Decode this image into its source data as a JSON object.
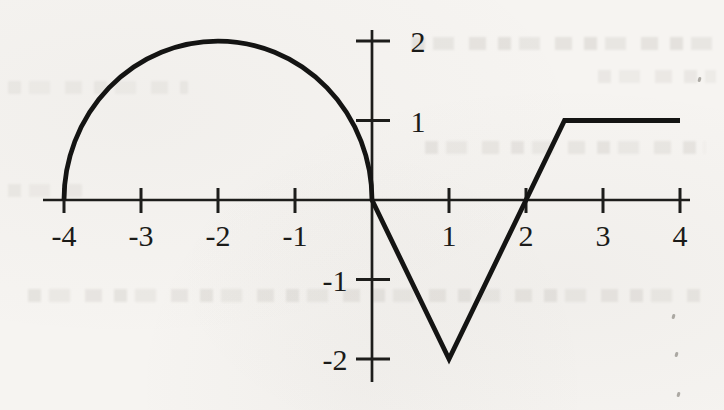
{
  "chart_data": {
    "type": "line",
    "title": "",
    "xlabel": "",
    "ylabel": "",
    "xlim": [
      -4.3,
      4.15
    ],
    "ylim": [
      -2.3,
      2.15
    ],
    "grid": false,
    "legend": false,
    "x_ticks": [
      -4,
      -3,
      -2,
      -1,
      1,
      2,
      3,
      4
    ],
    "y_ticks": [
      2,
      1,
      -1,
      -2
    ],
    "colors": {
      "curve": "#141413",
      "axis": "#1d1d1b",
      "labels": "#1b1b19",
      "paper": "#f6f4f1"
    },
    "segments": [
      {
        "kind": "semicircle_upper",
        "center": [
          -2,
          0
        ],
        "radius": 2,
        "start": [
          -4,
          0
        ],
        "end": [
          0,
          0
        ]
      },
      {
        "kind": "line",
        "start": [
          0,
          0
        ],
        "end": [
          1,
          -2
        ]
      },
      {
        "kind": "line",
        "start": [
          1,
          -2
        ],
        "end": [
          2.5,
          1
        ]
      },
      {
        "kind": "line",
        "start": [
          2.5,
          1
        ],
        "end": [
          4,
          1
        ]
      }
    ],
    "key_points": [
      [
        -4,
        0
      ],
      [
        -2,
        2
      ],
      [
        0,
        0
      ],
      [
        1,
        -2
      ],
      [
        2,
        0
      ],
      [
        2.5,
        1
      ],
      [
        4,
        1
      ]
    ]
  }
}
